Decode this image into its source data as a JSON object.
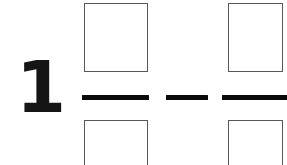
{
  "document": {
    "type": "math-worksheet-fraction-problem",
    "background_color": "#ffffff",
    "ink_color": "#0a0a0a",
    "box_border_color": "#58585c"
  },
  "problem": {
    "leading_number": "1",
    "expression_terms": [
      {
        "kind": "fraction",
        "numerator_value": "",
        "numerator_placeholder": "",
        "denominator_value": "",
        "denominator_placeholder": "",
        "bar_label": "fraction-bar"
      },
      {
        "kind": "operator",
        "symbol": "−",
        "name": "minus"
      },
      {
        "kind": "fraction",
        "numerator_value": "",
        "numerator_placeholder": "",
        "denominator_value": "",
        "denominator_placeholder": "",
        "bar_label": "fraction-bar"
      }
    ]
  }
}
